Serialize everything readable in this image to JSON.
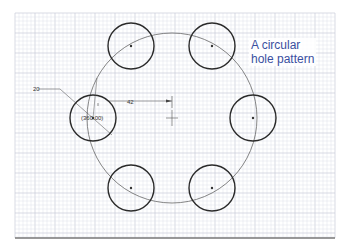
{
  "caption": {
    "line1": "A circular",
    "line2": "hole pattern",
    "color": "#3a4fa0"
  },
  "dimensions": {
    "diameter_label": "20",
    "radius_label": "42",
    "angle_label": "(360.00)"
  },
  "pattern": {
    "center": [
      172,
      118
    ],
    "bolt_circle_radius": 85,
    "hole_radius": 23,
    "hole_count": 6,
    "holes": [
      {
        "cx": 131,
        "cy": 46
      },
      {
        "cx": 212,
        "cy": 46
      },
      {
        "cx": 93,
        "cy": 118
      },
      {
        "cx": 253,
        "cy": 118
      },
      {
        "cx": 131,
        "cy": 188
      },
      {
        "cx": 212,
        "cy": 188
      }
    ]
  },
  "grid": {
    "x0": 15,
    "y0": 13,
    "x1": 335,
    "y1": 238,
    "minor": 4,
    "major": 20,
    "minor_color": "#dfe2ea",
    "major_color": "#c8ccd8"
  },
  "colors": {
    "hole_stroke": "#2a2a2a",
    "bolt_circle_stroke": "#666666",
    "baseline": "#777777"
  }
}
